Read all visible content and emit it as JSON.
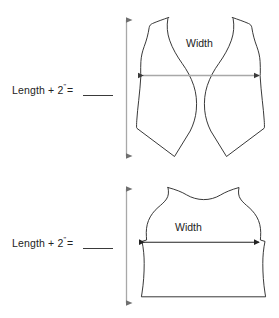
{
  "page": {
    "background_color": "#ffffff",
    "line_color": "#232323",
    "text_color": "#232323",
    "width_arrow_color_front": "#9d9d9d",
    "width_arrow_color_back": "#232323",
    "length_arrow_color": "#9d9d9d"
  },
  "diagrams": [
    {
      "id": "vest-front",
      "name": "Vest front panels",
      "length_label": {
        "prefix": "Length + 2",
        "inch_mark": "\"",
        "equals": "=",
        "blank": ""
      },
      "width_label": "Width",
      "length_arrow": {
        "orientation": "vertical",
        "double_headed": true
      },
      "width_arrow": {
        "orientation": "horizontal",
        "double_headed": true
      }
    },
    {
      "id": "vest-back",
      "name": "Vest back panel",
      "length_label": {
        "prefix": "Length + 2",
        "inch_mark": "\"",
        "equals": "=",
        "blank": ""
      },
      "width_label": "Width",
      "length_arrow": {
        "orientation": "vertical",
        "double_headed": true
      },
      "width_arrow": {
        "orientation": "horizontal",
        "double_headed": true
      }
    }
  ]
}
